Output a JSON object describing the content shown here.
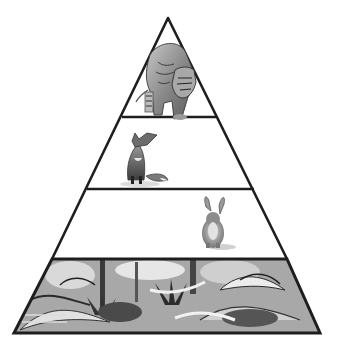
{
  "diagram": {
    "type": "food-pyramid",
    "style": "grayscale pencil illustration",
    "canvas": {
      "width": 338,
      "height": 352,
      "background": "#ffffff"
    },
    "apex": {
      "x": 168,
      "y": 18
    },
    "base": {
      "y": 333,
      "left_x": 14,
      "right_x": 320
    },
    "dividers": [
      {
        "y": 117,
        "left_x": 122,
        "right_x": 216
      },
      {
        "y": 189,
        "left_x": 87,
        "right_x": 254
      },
      {
        "y": 259,
        "left_x": 52,
        "right_x": 287
      }
    ],
    "levels": [
      {
        "id": "apex-predator",
        "animal": "tiger",
        "position": "top tier",
        "fill": "#ffffff"
      },
      {
        "id": "secondary-consumer",
        "animal": "fox",
        "position": "second tier",
        "fill": "#ffffff"
      },
      {
        "id": "primary-consumer",
        "animal": "rabbit",
        "position": "third tier",
        "fill": "#ffffff"
      },
      {
        "id": "producers",
        "animal": "jungle vegetation",
        "position": "base tier",
        "fill": "#9a9a9a"
      }
    ],
    "colors": {
      "outline": "#1e1e1e",
      "shade_dark": "#3a3a3a",
      "shade_mid": "#7a7a7a",
      "shade_light": "#b8b8b8",
      "shade_pale": "#dcdcdc"
    }
  }
}
